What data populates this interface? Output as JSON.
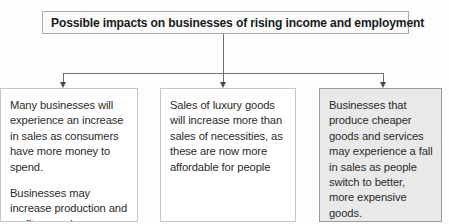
{
  "diagram": {
    "title_box": {
      "label": "Possible impacts on businesses of rising income and employment"
    },
    "boxes": [
      {
        "name": "increased-sales",
        "style": "plain",
        "paragraphs": [
          "Many businesses will experience an increase in sales as consumers have more money to spend.",
          "Businesses may increase production and profits may rise."
        ]
      },
      {
        "name": "luxury-goods-sales",
        "style": "plain",
        "paragraphs": [
          "Sales of luxury goods will increase more than sales of necessities, as these are now more affordable for people"
        ]
      },
      {
        "name": "cheaper-goods-fall",
        "style": "shaded",
        "paragraphs": [
          "Businesses that produce cheaper goods and services may experience a fall in sales as people switch to better, more expensive goods."
        ]
      }
    ],
    "connectors": {
      "stem_label": "title-to-branch-stem",
      "branch_label": "horizontal-distributor",
      "arrow_labels": [
        "arrow-to-box-1",
        "arrow-to-box-2",
        "arrow-to-box-3"
      ]
    },
    "colors": {
      "line": "#6d6d6d",
      "arrow": "#4a4a4a",
      "title_border": "#a9a9a9",
      "box_border": "#c6c6c6",
      "shaded_box_fill": "#e9e9e9",
      "shaded_box_border": "#9a9a9a",
      "text": "#2b2b2b"
    }
  }
}
